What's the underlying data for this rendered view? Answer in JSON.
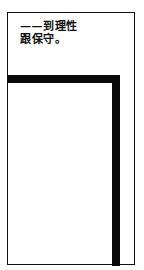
{
  "document": {
    "text_lines": [
      "——到理性",
      "跟保守。"
    ]
  },
  "colors": {
    "ink": "#111111",
    "background": "#ffffff"
  }
}
